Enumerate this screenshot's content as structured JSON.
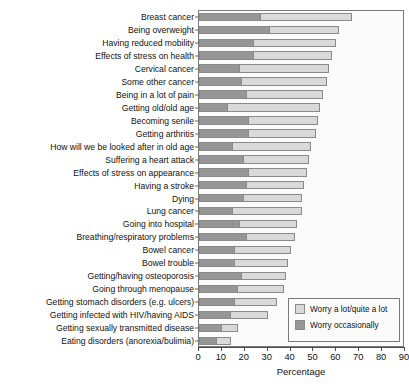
{
  "chart_data": {
    "type": "bar",
    "orientation": "horizontal",
    "stacked": true,
    "title": "",
    "xlabel": "Percentage",
    "ylabel": "",
    "xlim": [
      0,
      90
    ],
    "xticks": [
      0,
      10,
      20,
      30,
      40,
      50,
      60,
      70,
      80,
      90
    ],
    "grid": false,
    "legend_position": "bottom-right",
    "categories": [
      "Breast cancer",
      "Being overweight",
      "Having reduced mobility",
      "Effects of stress on health",
      "Cervical cancer",
      "Some other cancer",
      "Being in a lot of pain",
      "Getting old/old age",
      "Becoming senile",
      "Getting arthritis",
      "How will we be looked after in old age",
      "Suffering a heart attack",
      "Effects of stress on appearance",
      "Having a stroke",
      "Dying",
      "Lung cancer",
      "Going into hospital",
      "Breathing/respiratory problems",
      "Bowel cancer",
      "Bowel trouble",
      "Getting/having osteoporosis",
      "Going through menopause",
      "Getting stomach disorders (e.g. ulcers)",
      "Getting infected with HIV/having AIDS",
      "Getting sexually transmitted disease",
      "Eating disorders (anorexia/bulimia)"
    ],
    "series": [
      {
        "name": "Worry occasionally",
        "color": "#969696",
        "values": [
          26,
          30,
          23,
          23,
          17,
          18,
          20,
          12,
          21,
          21,
          14,
          19,
          21,
          20,
          19,
          14,
          17,
          20,
          15,
          15,
          18,
          16,
          15,
          13,
          9,
          7
        ]
      },
      {
        "name": "Worry a lot/quite a lot",
        "color": "#d9d9d9",
        "values": [
          41,
          31,
          37,
          35,
          40,
          38,
          34,
          41,
          31,
          30,
          35,
          29,
          26,
          26,
          26,
          31,
          26,
          22,
          25,
          24,
          20,
          21,
          19,
          17,
          8,
          7
        ]
      }
    ],
    "totals": [
      67,
      61,
      60,
      58,
      57,
      56,
      54,
      53,
      52,
      51,
      49,
      48,
      47,
      46,
      45,
      45,
      43,
      42,
      40,
      39,
      38,
      37,
      34,
      30,
      17,
      14
    ],
    "legend": [
      {
        "label": "Worry a lot/quite a lot",
        "color": "#d9d9d9"
      },
      {
        "label": "Worry occasionally",
        "color": "#969696"
      }
    ]
  }
}
